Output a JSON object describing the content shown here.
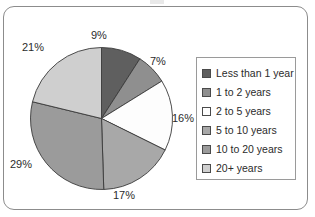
{
  "frame": {
    "border_color": "#8c8c8c"
  },
  "chart_data": {
    "type": "pie",
    "title": "",
    "categories": [
      "Less than 1 year",
      "1 to 2 years",
      "2 to 5 years",
      "5 to 10 years",
      "10 to 20 years",
      "20+ years"
    ],
    "values": [
      9,
      7,
      16,
      17,
      29,
      21
    ],
    "value_labels": [
      "9%",
      "7%",
      "16%",
      "17%",
      "29%",
      "21%"
    ],
    "units": "percent",
    "start_angle_deg": 0,
    "direction": "clockwise",
    "colors": [
      "#5f5f5f",
      "#8f8f8f",
      "#fdfdfd",
      "#a8a8a8",
      "#9b9b9b",
      "#cfcfcf"
    ],
    "slice_border_color": "#3a3a3a",
    "legend": {
      "position": "right",
      "border_color": "#9a9a9a",
      "entries": [
        {
          "label": "Less than 1 year",
          "color": "#5f5f5f"
        },
        {
          "label": "1 to 2 years",
          "color": "#8f8f8f"
        },
        {
          "label": "2 to 5 years",
          "color": "#fdfdfd"
        },
        {
          "label": "5 to 10 years",
          "color": "#a8a8a8"
        },
        {
          "label": "10 to 20 years",
          "color": "#9b9b9b"
        },
        {
          "label": "20+ years",
          "color": "#cfcfcf"
        }
      ]
    },
    "grid": false,
    "xlabel": "",
    "ylabel": ""
  },
  "labels": {
    "p1": "9%",
    "p2": "7%",
    "p3": "16%",
    "p4": "17%",
    "p5": "29%",
    "p6": "21%"
  }
}
